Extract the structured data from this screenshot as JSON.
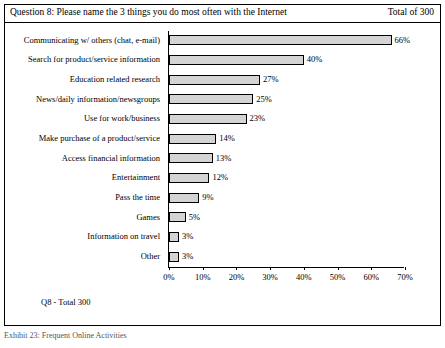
{
  "header": {
    "question": "Question 8: Please name the 3 things you do most often with the Internet",
    "total": "Total of 300"
  },
  "footnote": "Q8 - Total 300",
  "caption": "Exhibit 23: Frequent Online Activities",
  "chart_data": {
    "type": "bar",
    "orientation": "horizontal",
    "title": "Question 8: Please name the 3 things you do most often with the Internet",
    "xlabel": "",
    "ylabel": "",
    "xlim": [
      0,
      70
    ],
    "grid": false,
    "legend": null,
    "categories": [
      "Communicating w/ others (chat, e-mail)",
      "Search for product/service information",
      "Education related research",
      "News/daily information/newsgroups",
      "Use for work/business",
      "Make purchase of a product/service",
      "Access financial information",
      "Entertainment",
      "Pass the time",
      "Games",
      "Information on travel",
      "Other"
    ],
    "values": [
      66,
      40,
      27,
      25,
      23,
      14,
      13,
      12,
      9,
      5,
      3,
      3
    ],
    "data_labels": [
      "66%",
      "40%",
      "27%",
      "25%",
      "23%",
      "14%",
      "13%",
      "12%",
      "9%",
      "5%",
      "3%",
      "3%"
    ],
    "xticks": [
      0,
      10,
      20,
      30,
      40,
      50,
      60,
      70
    ],
    "xticklabels": [
      "0%",
      "10%",
      "20%",
      "30%",
      "40%",
      "50%",
      "60%",
      "70%"
    ],
    "bar_color": "#d4d4d4",
    "bar_edge_color": "#000000"
  }
}
